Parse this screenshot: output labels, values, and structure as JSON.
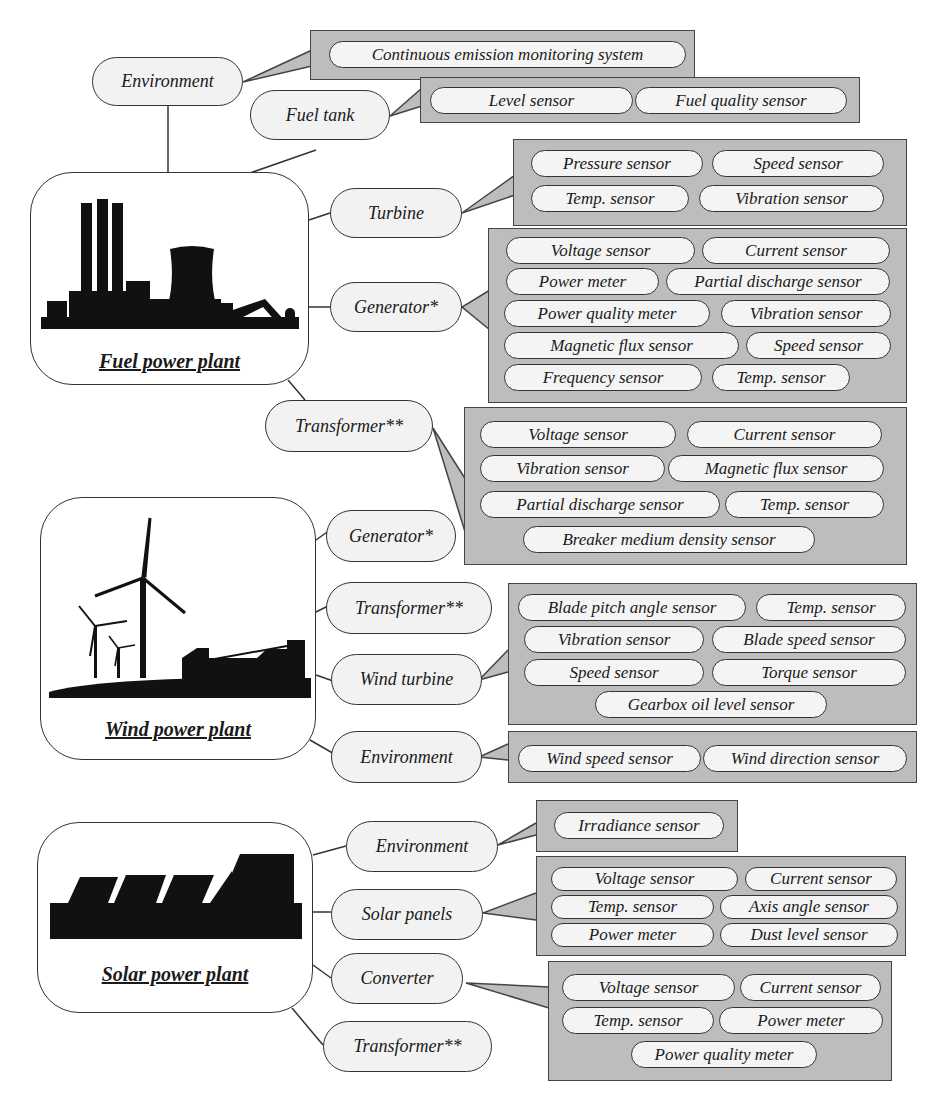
{
  "plants": {
    "fuel": {
      "label": "Fuel power plant",
      "icon": "fuel-plant-silhouette-icon",
      "components": {
        "environment": {
          "label": "Environment",
          "sensors": [
            "Continuous emission monitoring system"
          ]
        },
        "fuel_tank": {
          "label": "Fuel tank",
          "sensors": [
            "Level sensor",
            "Fuel quality sensor"
          ]
        },
        "turbine": {
          "label": "Turbine",
          "sensors": [
            "Pressure sensor",
            "Speed sensor",
            "Temp. sensor",
            "Vibration sensor"
          ]
        },
        "generator": {
          "label": "Generator*",
          "sensors": [
            "Voltage sensor",
            "Current sensor",
            "Power meter",
            "Partial discharge sensor",
            "Power quality meter",
            "Vibration sensor",
            "Magnetic flux sensor",
            "Speed sensor",
            "Frequency sensor",
            "Temp. sensor"
          ]
        },
        "transformer": {
          "label": "Transformer**",
          "sensors": [
            "Voltage sensor",
            "Current sensor",
            "Vibration sensor",
            "Magnetic flux sensor",
            "Partial discharge sensor",
            "Temp. sensor",
            "Breaker medium density sensor"
          ]
        }
      }
    },
    "wind": {
      "label": "Wind power plant",
      "icon": "wind-turbine-silhouette-icon",
      "components": {
        "generator": {
          "label": "Generator*"
        },
        "transformer": {
          "label": "Transformer**"
        },
        "wind_turbine": {
          "label": "Wind turbine",
          "sensors": [
            "Blade pitch angle sensor",
            "Temp. sensor",
            "Vibration sensor",
            "Blade speed sensor",
            "Speed sensor",
            "Torque sensor",
            "Gearbox oil level sensor"
          ]
        },
        "environment": {
          "label": "Environment",
          "sensors": [
            "Wind speed sensor",
            "Wind direction sensor"
          ]
        }
      }
    },
    "solar": {
      "label": "Solar power plant",
      "icon": "solar-panel-silhouette-icon",
      "components": {
        "environment": {
          "label": "Environment",
          "sensors": [
            "Irradiance sensor"
          ]
        },
        "solar_panels": {
          "label": "Solar panels",
          "sensors": [
            "Voltage sensor",
            "Current sensor",
            "Temp. sensor",
            "Axis angle sensor",
            "Power meter",
            "Dust level sensor"
          ]
        },
        "converter": {
          "label": "Converter",
          "sensors": [
            "Voltage sensor",
            "Current sensor",
            "Temp. sensor",
            "Power meter",
            "Power quality meter"
          ]
        },
        "transformer": {
          "label": "Transformer**"
        }
      }
    }
  },
  "colors": {
    "callout_fill": "#bdbdbd",
    "node_fill": "#f2f2f2",
    "pill_fill": "#f4f4f4",
    "stroke": "#333333",
    "silhouette": "#111111"
  }
}
